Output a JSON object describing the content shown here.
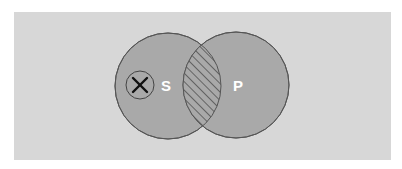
{
  "diagram": {
    "type": "venn",
    "colors": {
      "panel_background": "#d7d7d7",
      "circle_fill": "#a9a9a9",
      "circle_stroke": "#555555",
      "hatch_stroke": "#333333",
      "label_color": "#ffffff",
      "marker_stroke": "#111111"
    },
    "sets": [
      {
        "id": "S",
        "label": "S",
        "cx": 168,
        "cy": 86,
        "r": 53
      },
      {
        "id": "P",
        "label": "P",
        "cx": 236,
        "cy": 85,
        "r": 53
      }
    ],
    "intersection": {
      "style": "hatched"
    },
    "marker": {
      "symbol": "X",
      "in_set": "S",
      "outside_set": "P",
      "cx": 140,
      "cy": 85,
      "r": 14
    }
  }
}
